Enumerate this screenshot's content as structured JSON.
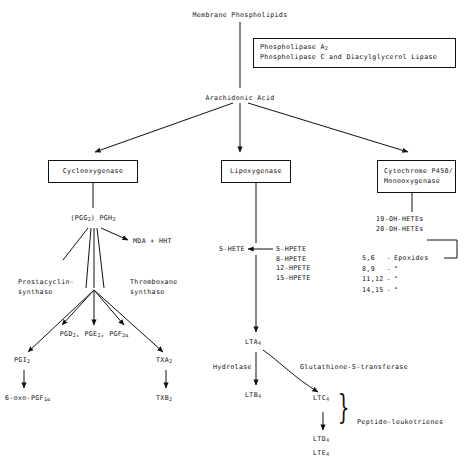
{
  "diagram": {
    "nodes": {
      "membrane_phospholipids": "Membrane Phospholipids",
      "arachidonic_acid": "Arachidonic Acid",
      "enzyme_box": {
        "line1_a": "Phospholipase A",
        "line1_sub": "2",
        "line2": "Phospholipase C and Diacylglycerol Lipase"
      },
      "cyclooxygenase": "Cyclooxygenase",
      "lipoxygenase": "Lipoxygenase",
      "cytochrome": {
        "line1": "Cytochrome P450/",
        "line2": "Monooxygenase"
      },
      "pgg_pgh": {
        "pgg": "(PGG",
        "pgg_sub": "2",
        "mid": ")  PGH",
        "pgh_sub": "2"
      },
      "mda_hht": "MDA + HHT",
      "prostacyclin_synthase": {
        "line1": "Prostacyclin-",
        "line2": "synthase"
      },
      "thromboxane_synthase": {
        "line1": "Thromboxane",
        "line2": "synthase"
      },
      "pg_products": {
        "pgd": "PGD",
        "pgd_sub": "2",
        "pge": "PGE",
        "pge_sub": "2",
        "pgf": "PGF",
        "pgf_sub": "2α"
      },
      "pgi2": {
        "name": "PGI",
        "sub": "2"
      },
      "oxo_pgf": {
        "name": "6-oxo-PGF",
        "sub": "1α"
      },
      "txa2": {
        "name": "TXA",
        "sub": "2"
      },
      "txb2": {
        "name": "TXB",
        "sub": "2"
      },
      "hete5": "5-HETE",
      "hpete_list": [
        "5-HPETE",
        "8-HPETE",
        "12-HPETE",
        "15-HPETE"
      ],
      "lta4": {
        "name": "LTA",
        "sub": "4"
      },
      "hydrolase": "Hydrolase",
      "glutathione_s_transferase": "Glutathione-S-transferase",
      "ltb4": {
        "name": "LTB",
        "sub": "4"
      },
      "ltc4": {
        "name": "LTC",
        "sub": "4"
      },
      "ltd4": {
        "name": "LTD",
        "sub": "4"
      },
      "lte4": {
        "name": "LTE",
        "sub": "4"
      },
      "peptido_leukotrienes": "Peptido-leukotrienes",
      "oh_hetes": [
        "19-OH-HETEs",
        "20-OH-HETEs"
      ],
      "epoxides": [
        {
          "positions": "5,6",
          "dash": "-",
          "name": "Epoxides"
        },
        {
          "positions": "8,9",
          "dash": "-",
          "name": "\""
        },
        {
          "positions": "11,12",
          "dash": "-",
          "name": "\""
        },
        {
          "positions": "14,15",
          "dash": "-",
          "name": "\""
        }
      ],
      "brace_symbol": "}"
    },
    "colors": {
      "line": "#111111",
      "background": "#ffffff",
      "text": "#111111"
    }
  }
}
